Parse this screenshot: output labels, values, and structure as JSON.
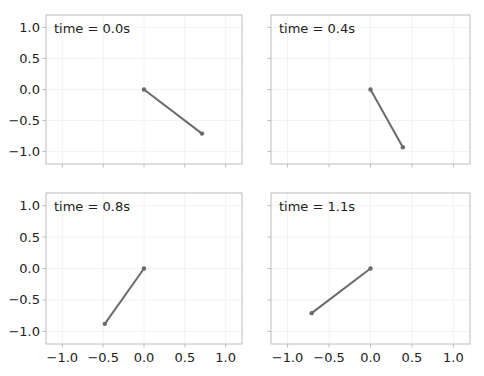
{
  "figure": {
    "layout": {
      "rows": 2,
      "cols": 2
    },
    "colors": {
      "line": "#6b6b6b",
      "frame": "#bcbcbc",
      "grid": "#f2f2f2",
      "text": "#222222"
    }
  },
  "chart_data": [
    {
      "type": "line",
      "title": "",
      "annotation": "time = 0.0s",
      "x": [
        0.0,
        0.71
      ],
      "y": [
        0.0,
        -0.71
      ],
      "xlim": [
        -1.2,
        1.2
      ],
      "ylim": [
        -1.2,
        1.2
      ],
      "xticks": [
        -1.0,
        -0.5,
        0.0,
        0.5,
        1.0
      ],
      "yticks": [
        -1.0,
        -0.5,
        0.0,
        0.5,
        1.0
      ],
      "xtick_labels": [],
      "ytick_labels": [
        "−1.0",
        "−0.5",
        "0.0",
        "0.5",
        "1.0"
      ],
      "grid": true
    },
    {
      "type": "line",
      "title": "",
      "annotation": "time = 0.4s",
      "x": [
        0.0,
        0.39
      ],
      "y": [
        0.0,
        -0.93
      ],
      "xlim": [
        -1.2,
        1.2
      ],
      "ylim": [
        -1.2,
        1.2
      ],
      "xticks": [
        -1.0,
        -0.5,
        0.0,
        0.5,
        1.0
      ],
      "yticks": [
        -1.0,
        -0.5,
        0.0,
        0.5,
        1.0
      ],
      "xtick_labels": [],
      "ytick_labels": [],
      "grid": true
    },
    {
      "type": "line",
      "title": "",
      "annotation": "time = 0.8s",
      "x": [
        0.0,
        -0.48
      ],
      "y": [
        0.0,
        -0.88
      ],
      "xlim": [
        -1.2,
        1.2
      ],
      "ylim": [
        -1.2,
        1.2
      ],
      "xticks": [
        -1.0,
        -0.5,
        0.0,
        0.5,
        1.0
      ],
      "yticks": [
        -1.0,
        -0.5,
        0.0,
        0.5,
        1.0
      ],
      "xtick_labels": [
        "−1.0",
        "−0.5",
        "0.0",
        "0.5",
        "1.0"
      ],
      "ytick_labels": [
        "−1.0",
        "−0.5",
        "0.0",
        "0.5",
        "1.0"
      ],
      "grid": true
    },
    {
      "type": "line",
      "title": "",
      "annotation": "time = 1.1s",
      "x": [
        0.0,
        -0.71
      ],
      "y": [
        0.0,
        -0.71
      ],
      "xlim": [
        -1.2,
        1.2
      ],
      "ylim": [
        -1.2,
        1.2
      ],
      "xticks": [
        -1.0,
        -0.5,
        0.0,
        0.5,
        1.0
      ],
      "yticks": [
        -1.0,
        -0.5,
        0.0,
        0.5,
        1.0
      ],
      "xtick_labels": [
        "−1.0",
        "−0.5",
        "0.0",
        "0.5",
        "1.0"
      ],
      "ytick_labels": [],
      "grid": true
    }
  ]
}
